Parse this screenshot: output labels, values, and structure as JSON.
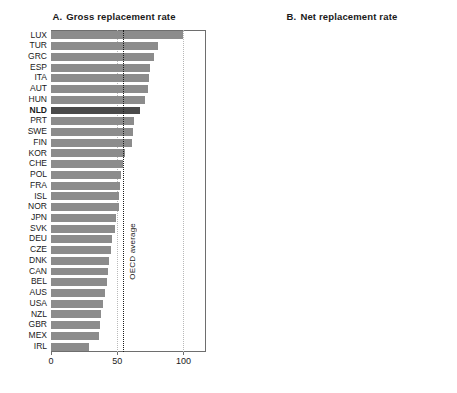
{
  "figure": {
    "width": 457,
    "height": 393,
    "background": "#ffffff",
    "bar_color": "#8c8c8c",
    "highlight_color": "#4a4a4a",
    "highlight_country": "NLD"
  },
  "chart_data": [
    {
      "type": "bar",
      "orientation": "horizontal",
      "panel_letter": "A.",
      "title": "Gross replacement rate",
      "xlabel": "",
      "ylabel": "",
      "xlim": [
        0,
        117
      ],
      "xticks": [
        0,
        50,
        100
      ],
      "xticklabels": [
        "0",
        "50",
        "100"
      ],
      "grid": "vertical-dotted",
      "legend": "none",
      "annotations": [
        {
          "label": "OECD average",
          "value": 54,
          "style": "dotted-vline"
        }
      ],
      "categories": [
        "LUX",
        "TUR",
        "GRC",
        "ESP",
        "ITA",
        "AUT",
        "HUN",
        "NLD",
        "PRT",
        "SWE",
        "FIN",
        "KOR",
        "CHE",
        "POL",
        "FRA",
        "ISL",
        "NOR",
        "JPN",
        "SVK",
        "DEU",
        "CZE",
        "DNK",
        "CAN",
        "BEL",
        "AUS",
        "USA",
        "NZL",
        "GBR",
        "MEX",
        "IRL"
      ],
      "values": [
        100,
        81,
        78,
        75,
        74,
        73,
        71,
        67,
        63,
        62,
        61,
        56,
        54,
        53,
        52,
        51,
        51,
        49,
        48,
        46,
        45,
        44,
        43,
        42,
        41,
        39,
        38,
        37,
        36,
        29
      ]
    },
    {
      "type": "bar",
      "orientation": "horizontal",
      "panel_letter": "B.",
      "title": "Net replacement rate",
      "xlabel": "",
      "ylabel": "",
      "xlim": [
        0,
        120
      ],
      "xticks": [
        0,
        50,
        100
      ],
      "xticklabels": [
        "0",
        "50",
        "100"
      ],
      "grid": "vertical-dotted",
      "legend": "none",
      "annotations": [
        {
          "label": "OECD average",
          "value": 68,
          "style": "dotted-vline"
        }
      ],
      "categories": [
        "LUX",
        "TUR",
        "GRC",
        "AUT",
        "HUN",
        "ITA",
        "ESP",
        "NLD",
        "PRT",
        "DEU",
        "FIN",
        "POL",
        "FRA",
        "SWE",
        "CHE",
        "ISL",
        "NOR",
        "BEL",
        "KOR",
        "SVK",
        "JPN",
        "CZE",
        "CAN",
        "DNK",
        "AUS",
        "USA",
        "GBR",
        "MEX",
        "NZL",
        "IRL"
      ],
      "values": [
        111,
        107,
        102,
        95,
        93,
        90,
        89,
        85,
        80,
        74,
        73,
        72,
        72,
        71,
        68,
        67,
        66,
        64,
        64,
        60,
        59,
        58,
        57,
        53,
        52,
        50,
        47,
        45,
        40,
        36
      ]
    }
  ]
}
